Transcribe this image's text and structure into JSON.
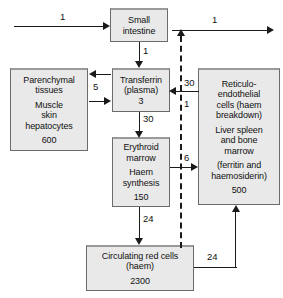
{
  "diagram": {
    "colors": {
      "box_fill": "#e9e9e9",
      "box_border": "#6b6b6b",
      "arrow": "#1a1a1a",
      "text": "#111111",
      "background": "#ffffff"
    },
    "boxes": {
      "small_intestine": {
        "lines": [
          "Small",
          "intestine"
        ],
        "value": ""
      },
      "parenchymal_tissues": {
        "lines": [
          "Parenchymal",
          "tissues"
        ],
        "lines2": [
          "Muscle",
          "skin",
          "hepatocytes"
        ],
        "value": "600"
      },
      "transferrin": {
        "lines": [
          "Transferrin",
          "(plasma)"
        ],
        "value": "3"
      },
      "reticuloendothelial": {
        "lines": [
          "Reticulo-",
          "endothelial",
          "cells (haem",
          "breakdown)"
        ],
        "lines2": [
          "Liver spleen",
          "and bone",
          "marrow"
        ],
        "lines3": [
          "(ferritin and",
          "haemosiderin)"
        ],
        "value": "500"
      },
      "erythroid_marrow": {
        "lines": [
          "Erythroid",
          "marrow"
        ],
        "lines2": [
          "Haem",
          "synthesis"
        ],
        "value": "150"
      },
      "circulating_red_cells": {
        "lines": [
          "Circulating red cells",
          "(haem)"
        ],
        "value": "2300"
      }
    },
    "fluxes": {
      "dietary_absorption": "1",
      "iron_loss": "1",
      "intestine_to_transferrin": "1",
      "parenchymal_exchange": "5",
      "re_to_transferrin": "30",
      "transferrin_to_marrow": "30",
      "dashed_recycle": "1",
      "marrow_to_re": "6",
      "marrow_to_redcells": "24",
      "redcells_to_re": "24"
    }
  }
}
